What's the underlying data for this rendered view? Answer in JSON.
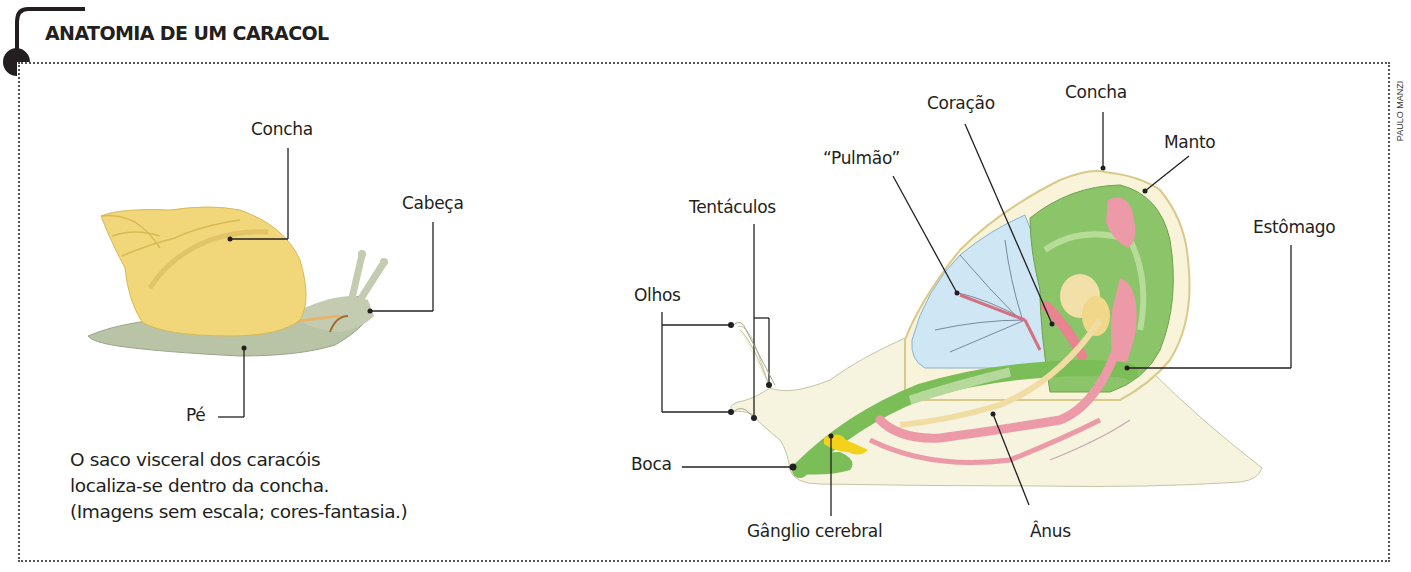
{
  "header": {
    "title": "ANATOMIA DE UM CARACOL",
    "credit": "PAULO MANZI"
  },
  "external_view": {
    "labels": {
      "shell": "Concha",
      "head": "Cabeça",
      "foot": "Pé"
    },
    "caption": [
      "O saco visceral dos caracóis",
      "localiza-se dentro da concha.",
      "(Imagens sem escala; cores-fantasia.)"
    ]
  },
  "internal_view": {
    "labels": {
      "heart": "Coração",
      "shell": "Concha",
      "lung": "“Pulmão”",
      "mantle": "Manto",
      "tentacles": "Tentáculos",
      "stomach": "Estômago",
      "eyes": "Olhos",
      "mouth": "Boca",
      "cerebral_ganglion": "Gânglio cerebral",
      "anus": "Ânus"
    }
  },
  "colors": {
    "shell_yellow": "#f1d77a",
    "foot_gray_green": "#b7c2a3",
    "body_cream": "#f6f3df",
    "mantle_green": "#8cc46a",
    "lung_blue": "#cfe6f5",
    "organ_pink": "#ec9aa8",
    "ganglion_yellow": "#f2d21a",
    "line": "#231f20"
  }
}
